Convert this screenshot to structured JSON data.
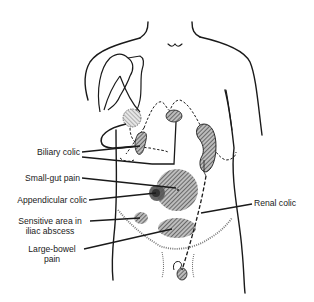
{
  "figure": {
    "colors": {
      "line": "#1a1a1a",
      "hatch_fill": "#777777",
      "dark_fill": "#444444",
      "background": "#ffffff"
    }
  },
  "labels": {
    "biliary_colic": "Biliary colic",
    "small_gut_pain": "Small-gut pain",
    "appendicular_colic": "Appendicular colic",
    "sensitive_area_line1": "Sensitive area in",
    "sensitive_area_line2": "iliac abscess",
    "large_bowel_line1": "Large-bowel",
    "large_bowel_line2": "pain",
    "renal_colic": "Renal colic"
  }
}
